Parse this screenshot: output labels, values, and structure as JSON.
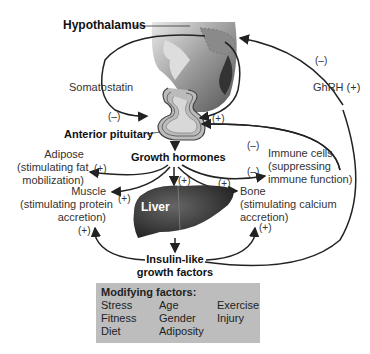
{
  "nodes": {
    "hypothalamus": "Hypothalamus",
    "somatostatin": "Somatostatin",
    "ghrh": "GhRH (+)",
    "anterior_pituitary": "Anterior pituitary",
    "growth_hormones": "Growth hormones",
    "liver": "Liver",
    "igf_line1": "Insulin-like",
    "igf_line2": "growth factors",
    "adipose": [
      "Adipose",
      "(stimulating fat",
      "mobilization)"
    ],
    "muscle": [
      "Muscle",
      "(stimulating protein",
      "accretion)"
    ],
    "immune": [
      "Immune cells",
      "(suppressing",
      "immune function)"
    ],
    "bone": [
      "Bone",
      "(stimulating calcium",
      "accretion)"
    ]
  },
  "signs": {
    "somatostatin": "(–)",
    "ghrh_feedback": "(–)",
    "pituitary_plus": "(+)",
    "adipose": "(+)",
    "muscle": "(+)",
    "liver": "(+)",
    "bone": "(+)",
    "immune_top": "(–)",
    "immune_bottom": "(–)",
    "muscle_igf": "(+)",
    "bone_igf": "(+)"
  },
  "modifying_factors": {
    "title": "Modifying factors:",
    "columns": [
      [
        "Stress",
        "Fitness",
        "Diet"
      ],
      [
        "Age",
        "Gender",
        "Adiposity"
      ],
      [
        "Exercise",
        "Injury"
      ]
    ]
  }
}
